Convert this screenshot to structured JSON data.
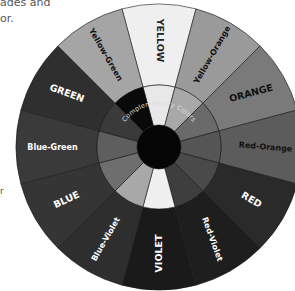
{
  "partial_text": {
    "line1": "ades and",
    "line2": "or.",
    "line3": "r"
  },
  "wheel": {
    "center_label": "Complementary Colors",
    "segments": [
      {
        "label": "YELLOW",
        "style": "caps",
        "outer": "#efefef",
        "inner": "#e8e8e8",
        "text": "#222222"
      },
      {
        "label": "Yellow-Orange",
        "style": "mixed",
        "outer": "#9a9a9a",
        "inner": "#a8a8a8",
        "text": "#111111"
      },
      {
        "label": "ORANGE",
        "style": "caps",
        "outer": "#7a7a7a",
        "inner": "#6a6a6a",
        "text": "#111111"
      },
      {
        "label": "Red-Orange",
        "style": "mixed",
        "outer": "#5c5c5c",
        "inner": "#555555",
        "text": "#111111"
      },
      {
        "label": "RED",
        "style": "caps",
        "outer": "#2a2a2a",
        "inner": "#4a4a4a",
        "text": "#ffffff"
      },
      {
        "label": "Red-Violet",
        "style": "mixed",
        "outer": "#1e1e1e",
        "inner": "#3e3e3e",
        "text": "#ffffff"
      },
      {
        "label": "VIOLET",
        "style": "caps",
        "outer": "#1a1a1a",
        "inner": "#f0f0f0",
        "text": "#ffffff"
      },
      {
        "label": "Blue-Violet",
        "style": "mixed",
        "outer": "#2e2e2e",
        "inner": "#a8a8a8",
        "text": "#ffffff"
      },
      {
        "label": "BLUE",
        "style": "caps",
        "outer": "#353535",
        "inner": "#6e6e6e",
        "text": "#ffffff"
      },
      {
        "label": "Blue-Green",
        "style": "mixed",
        "outer": "#3a3a3a",
        "inner": "#5e5e5e",
        "text": "#ffffff"
      },
      {
        "label": "GREEN",
        "style": "caps",
        "outer": "#2f2f2f",
        "inner": "#3a3a3a",
        "text": "#ffffff"
      },
      {
        "label": "Yellow-Green",
        "style": "mixed",
        "outer": "#a5a5a5",
        "inner": "#0a0a0a",
        "text": "#111111"
      }
    ]
  }
}
